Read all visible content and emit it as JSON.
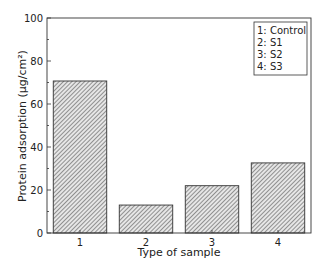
{
  "chart_data": {
    "type": "bar",
    "title": "",
    "xlabel": "Type of sample",
    "ylabel": "Protein adsorption (µg/cm²)",
    "categories": [
      "1",
      "2",
      "3",
      "4"
    ],
    "values": [
      70.7,
      13.0,
      22.0,
      32.6
    ],
    "ylim": [
      0,
      100
    ],
    "yticks": [
      0,
      20,
      40,
      60,
      80,
      100
    ],
    "grid": false,
    "bar_style": "diagonal-hatch",
    "legend": {
      "position": "upper right",
      "entries": [
        "1: Control",
        "2: S1",
        "3: S2",
        "4: S3"
      ]
    }
  }
}
